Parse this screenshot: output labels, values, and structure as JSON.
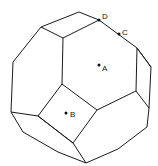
{
  "figure": {
    "type": "polyhedron-line-drawing",
    "line_color": "#1a1a1a",
    "background": "#ffffff",
    "points": [
      {
        "label": "A",
        "x": 99,
        "y": 65,
        "label_dx": 3,
        "label_dy": 5
      },
      {
        "label": "B",
        "x": 66,
        "y": 113,
        "label_dx": 4,
        "label_dy": 4
      },
      {
        "label": "C",
        "x": 119,
        "y": 34,
        "label_dx": 3,
        "label_dy": -1
      },
      {
        "label": "D",
        "x": 99,
        "y": 20,
        "label_dx": 3,
        "label_dy": -2
      }
    ]
  }
}
